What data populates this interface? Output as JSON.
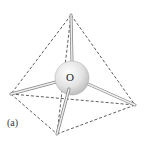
{
  "diagram": {
    "atom_label": "O",
    "panel_label": "(a)",
    "vertices": {
      "top": [
        71,
        15
      ],
      "left": [
        11,
        94
      ],
      "right": [
        135,
        105
      ],
      "bottom": [
        57,
        134
      ]
    },
    "center": [
      72,
      78
    ],
    "atom_radius": 17,
    "colors": {
      "edge": "#333333",
      "bond": "#bbbbbb",
      "atom": "#e6e6e6"
    }
  }
}
